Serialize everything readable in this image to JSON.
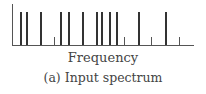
{
  "chart_data": {
    "type": "bar",
    "title": "",
    "xlabel": "Frequency",
    "ylabel": "",
    "caption": "(a)  Input spectrum",
    "grid": false,
    "legend": null,
    "x": [
      20,
      26,
      40,
      54,
      60,
      68,
      82,
      96,
      101,
      109,
      116,
      124,
      138,
      151,
      165,
      179
    ],
    "values": [
      1,
      1,
      1,
      0.25,
      1,
      1,
      1,
      1,
      1,
      1,
      1,
      0.25,
      1,
      0.25,
      1,
      0.25
    ],
    "ylim": [
      0,
      1.2
    ]
  },
  "labels": {
    "xlabel": "Frequency",
    "caption": "(a)  Input spectrum"
  }
}
